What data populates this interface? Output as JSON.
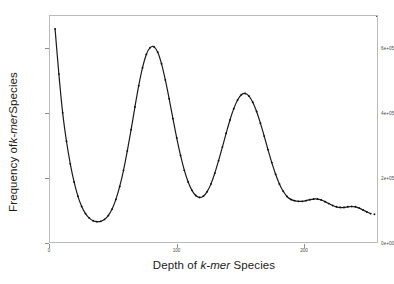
{
  "figure": {
    "background_color": "#ffffff",
    "panel_border_color": "#b9b9b9",
    "curve_color": "#1a1a1a",
    "point_color": "#111111"
  },
  "chart_data": {
    "type": "line",
    "title": "",
    "subtitle": "",
    "xlabel_plain": "Depth of k-mer Species",
    "ylabel_plain": "Frequency of k-mer Species",
    "xlabel_parts": [
      "Depth of ",
      "k-mer",
      " Species"
    ],
    "ylabel_parts": [
      "Frequency of ",
      "k-mer",
      " Species"
    ],
    "grid": false,
    "legend": null,
    "legend_position": "none",
    "markers": "small filled circles on curve",
    "xlim": [
      0,
      258
    ],
    "ylim": [
      0,
      700000
    ],
    "xticks": [
      0,
      100,
      200
    ],
    "xtick_labels": [
      "0",
      "100",
      "200"
    ],
    "yticks": [
      0,
      200000,
      400000,
      600000
    ],
    "ytick_labels": [
      "0e+00",
      "2e+05",
      "4e+05",
      "6e+05"
    ],
    "x": [
      4,
      7,
      10,
      13,
      16,
      19,
      22,
      25,
      28,
      31,
      34,
      37,
      40,
      43,
      46,
      49,
      52,
      55,
      58,
      61,
      64,
      67,
      70,
      73,
      76,
      79,
      82,
      85,
      88,
      91,
      94,
      97,
      100,
      103,
      106,
      109,
      112,
      115,
      118,
      121,
      124,
      127,
      130,
      133,
      136,
      139,
      142,
      145,
      148,
      151,
      154,
      157,
      160,
      163,
      166,
      169,
      172,
      175,
      178,
      181,
      184,
      187,
      190,
      193,
      196,
      199,
      202,
      205,
      208,
      211,
      214,
      217,
      220,
      223,
      226,
      229,
      232,
      235,
      238,
      241,
      244,
      247,
      250,
      253,
      256,
      258
    ],
    "y": [
      660000,
      520000,
      400000,
      312000,
      242000,
      186000,
      142000,
      110000,
      88000,
      74000,
      66000,
      63000,
      64000,
      70000,
      82000,
      102000,
      132000,
      172000,
      222000,
      282000,
      348000,
      418000,
      484000,
      540000,
      581000,
      602000,
      605000,
      588000,
      552000,
      502000,
      444000,
      382000,
      322000,
      268000,
      222000,
      186000,
      160000,
      144000,
      138000,
      142000,
      156000,
      180000,
      213000,
      252000,
      294000,
      337000,
      378000,
      413000,
      440000,
      456000,
      460000,
      452000,
      433000,
      404000,
      368000,
      328000,
      286000,
      246000,
      210000,
      180000,
      157000,
      141000,
      132000,
      128000,
      126000,
      126000,
      128000,
      131000,
      133000,
      133000,
      130000,
      125000,
      119000,
      113000,
      109000,
      107000,
      107000,
      109000,
      110000,
      109000,
      105000,
      99000,
      93000,
      88000,
      86000
    ],
    "annotations": [],
    "peaks": [
      {
        "x": 4,
        "y": 660000,
        "note": "left edge error-kmer spike"
      },
      {
        "x": 82,
        "y": 605000,
        "note": "first main peak"
      },
      {
        "x": 154,
        "y": 460000,
        "note": "second main peak"
      }
    ],
    "valleys": [
      {
        "x": 37,
        "y": 63000
      },
      {
        "x": 118,
        "y": 138000
      }
    ]
  }
}
